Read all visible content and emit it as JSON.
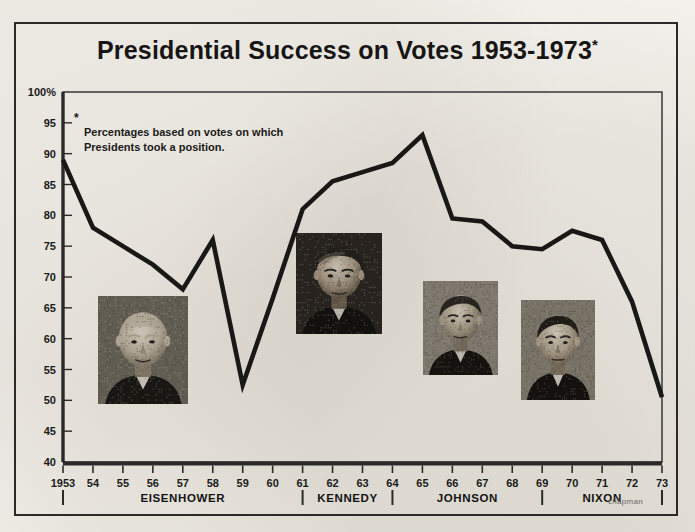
{
  "title": {
    "text": "Presidential Success on Votes 1953-1973",
    "asterisk": "*"
  },
  "footnote": {
    "marker": "*",
    "text": "Percentages based on votes on which\nPresidents took a position."
  },
  "signature": "chapman",
  "colors": {
    "line": "#191817",
    "axis": "#2b2a28",
    "text": "#1b1a19",
    "paper": "#f4f2ee"
  },
  "chart_data": {
    "type": "line",
    "title": "Presidential Success on Votes 1953-1973*",
    "xlabel": "",
    "ylabel": "",
    "ylim": [
      40,
      100
    ],
    "yticks": [
      40,
      45,
      50,
      55,
      60,
      65,
      70,
      75,
      80,
      85,
      90,
      95,
      100
    ],
    "ytick_labels": [
      "40",
      "45",
      "50",
      "55",
      "60",
      "65",
      "70",
      "75",
      "80",
      "85",
      "90",
      "95",
      "100%"
    ],
    "xlim": [
      1953,
      1973
    ],
    "x": [
      1953,
      1954,
      1955,
      1956,
      1957,
      1958,
      1959,
      1960,
      1961,
      1962,
      1963,
      1964,
      1965,
      1966,
      1967,
      1968,
      1969,
      1970,
      1971,
      1972,
      1973
    ],
    "xtick_labels": [
      "1953",
      "54",
      "55",
      "56",
      "57",
      "58",
      "59",
      "60",
      "61",
      "62",
      "63",
      "64",
      "65",
      "66",
      "67",
      "68",
      "69",
      "70",
      "71",
      "72",
      "73"
    ],
    "values": [
      89,
      78,
      75,
      72,
      68,
      76,
      52.5,
      66.5,
      81,
      85.5,
      87,
      88.5,
      93,
      79.5,
      79,
      75,
      74.5,
      77.5,
      76,
      66,
      50.5
    ],
    "grid": false,
    "legend": null,
    "series_name": "Presidential success rate (%)",
    "annotations": [
      {
        "text": "Percentages based on votes on which Presidents took a position.",
        "type": "footnote"
      }
    ]
  },
  "president_bands": [
    {
      "name": "EISENHOWER",
      "start": 1953,
      "end": 1961
    },
    {
      "name": "KENNEDY",
      "start": 1961,
      "end": 1964
    },
    {
      "name": "JOHNSON",
      "start": 1964,
      "end": 1969
    },
    {
      "name": "NIXON",
      "start": 1969,
      "end": 1973
    }
  ],
  "band_dividers": [
    1953,
    1961,
    1964,
    1969,
    1973
  ],
  "portraits": [
    {
      "name": "eisenhower-portrait",
      "label": "Eisenhower",
      "x": 98,
      "y": 296,
      "w": 90,
      "h": 108
    },
    {
      "name": "kennedy-portrait",
      "label": "Kennedy",
      "x": 296,
      "y": 233,
      "w": 86,
      "h": 101
    },
    {
      "name": "johnson-portrait",
      "label": "Johnson",
      "x": 423,
      "y": 281,
      "w": 75,
      "h": 94
    },
    {
      "name": "nixon-portrait",
      "label": "Nixon",
      "x": 521,
      "y": 300,
      "w": 74,
      "h": 100
    }
  ]
}
